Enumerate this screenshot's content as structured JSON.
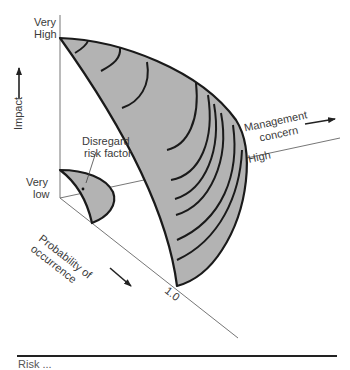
{
  "diagram": {
    "type": "3d-risk-surface",
    "axes": {
      "impact": {
        "label": "Impact",
        "high_label_line1": "Very",
        "high_label_line2": "High",
        "low_label_line1": "Very",
        "low_label_line2": "low"
      },
      "management_concern": {
        "label_line1": "Management",
        "label_line2": "concern",
        "tick_label": "High"
      },
      "probability": {
        "label_line1": "Probability of",
        "label_line2": "occurrence",
        "tick_label": "1.0"
      }
    },
    "annotations": {
      "disregard_line1": "Disregard",
      "disregard_line2": "risk factor"
    },
    "colors": {
      "fill": "#b3b3b3",
      "stroke": "#1a1a1a",
      "axis": "#555555"
    },
    "caption_partial": "Risk ..."
  }
}
